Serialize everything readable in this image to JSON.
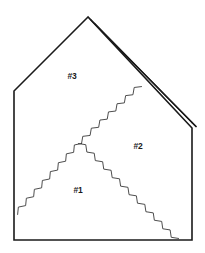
{
  "figure": {
    "background_color": "#ffffff",
    "line_color": "#1a1a1a",
    "zigzag_color": "#3a3a3a",
    "width": 205,
    "height": 253
  },
  "outline": {
    "name": "pentagon-outline",
    "points": "88,17 14,91 14,240 192,240 192,128"
  },
  "fold": {
    "name": "double-fold-edge",
    "label": "folded flap edge",
    "line_a": "90.5,19.5 192,122.5",
    "line_b": "94.5,23.5 196,126.5",
    "cap": "192,122.5 196,126.5"
  },
  "creases": [
    {
      "name": "crease-left",
      "from_x": 16,
      "from_y": 213,
      "to_x": 80,
      "to_y": 142,
      "amplitude": 2.2,
      "period": 6.0
    },
    {
      "name": "crease-right-down",
      "from_x": 80,
      "from_y": 142,
      "to_x": 177,
      "to_y": 240,
      "amplitude": 2.2,
      "period": 6.0
    },
    {
      "name": "crease-right-up",
      "from_x": 80,
      "from_y": 142,
      "to_x": 140,
      "to_y": 85,
      "amplitude": 2.2,
      "period": 6.0
    }
  ],
  "labels": [
    {
      "name": "region-label-3",
      "text": "#3",
      "x": 72,
      "y": 77
    },
    {
      "name": "region-label-2",
      "text": "#2",
      "x": 138,
      "y": 147
    },
    {
      "name": "region-label-1",
      "text": "#1",
      "x": 78,
      "y": 191
    }
  ]
}
